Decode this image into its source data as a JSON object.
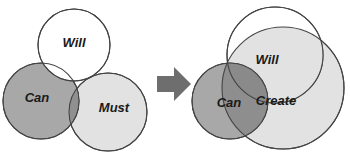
{
  "diagram": {
    "type": "venn-transformation",
    "colors": {
      "background": "#ffffff",
      "white_fill": "#ffffff",
      "medium_gray_fill": "#a8a8a8",
      "light_gray_fill": "#e2e2e2",
      "overlap_dark_fill": "#8e8e8e",
      "outline": "#444444",
      "arrow": "#6e6e6e",
      "text": "#1a1a1a"
    },
    "left_panel": {
      "name": "before",
      "circles": [
        {
          "id": "will",
          "label": "Will",
          "fill": "white_fill",
          "cx": 74,
          "cy": 45,
          "r": 36,
          "label_x": 74,
          "label_y": 44
        },
        {
          "id": "can",
          "label": "Can",
          "fill": "medium_gray_fill",
          "cx": 41,
          "cy": 101,
          "r": 38,
          "label_x": 37,
          "label_y": 99
        },
        {
          "id": "must",
          "label": "Must",
          "fill": "light_gray_fill",
          "cx": 108,
          "cy": 112,
          "r": 39,
          "label_x": 114,
          "label_y": 109
        }
      ]
    },
    "arrow": {
      "id": "transform-arrow",
      "direction": "right",
      "x": 157,
      "y": 67,
      "width": 34,
      "height": 34
    },
    "right_panel": {
      "name": "after",
      "circles": [
        {
          "id": "create",
          "label": "Create",
          "fill": "light_gray_fill",
          "cx": 283,
          "cy": 88,
          "r": 61,
          "label_x": 276,
          "label_y": 102
        },
        {
          "id": "will",
          "label": "Will",
          "fill": "white_fill",
          "cx": 275,
          "cy": 55,
          "r": 48,
          "label_x": 267,
          "label_y": 61
        },
        {
          "id": "can",
          "label": "Can",
          "fill": "medium_gray_fill",
          "cx": 230,
          "cy": 101,
          "r": 38,
          "label_x": 229,
          "label_y": 104
        }
      ]
    }
  }
}
